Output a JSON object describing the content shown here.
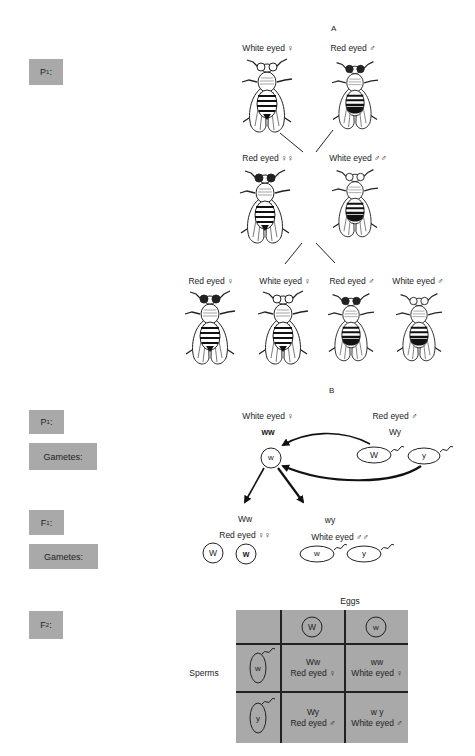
{
  "section_a": {
    "title": "A",
    "p1_label": "P",
    "p1_sub": "1",
    "p1_suffix": ":",
    "parents": [
      {
        "caption": "White eyed ♀",
        "eye": "white",
        "sex": "female"
      },
      {
        "caption": "Red eyed ♂",
        "eye": "red",
        "sex": "male"
      }
    ],
    "f1": [
      {
        "caption": "Red eyed ♀♀",
        "eye": "red",
        "sex": "female"
      },
      {
        "caption": "White eyed ♂♂",
        "eye": "white",
        "sex": "male"
      }
    ],
    "f2": [
      {
        "caption": "Red eyed ♀",
        "eye": "red",
        "sex": "female"
      },
      {
        "caption": "White eyed ♀",
        "eye": "white",
        "sex": "female"
      },
      {
        "caption": "Red eyed ♂",
        "eye": "red",
        "sex": "male"
      },
      {
        "caption": "White eyed ♂",
        "eye": "white",
        "sex": "male"
      }
    ]
  },
  "section_b": {
    "title": "B",
    "labels": {
      "p1": "P",
      "p1_sub": "1",
      "gametes_1": "Gametes:",
      "f1": "F",
      "f1_sub": "1",
      "gametes_2": "Gametes:",
      "f2": "F",
      "f2_sub": "2"
    },
    "p1_female": {
      "caption": "White eyed ♀",
      "genotype": "ww",
      "gamete": "w"
    },
    "p1_male": {
      "caption": "Red eyed ♂",
      "genotype": "Wy",
      "gametes": [
        "W",
        "y"
      ]
    },
    "f1_female": {
      "genotype": "Ww",
      "caption": "Red eyed ♀♀",
      "gametes": [
        "W",
        "w"
      ]
    },
    "f1_male": {
      "genotype": "wy",
      "caption": "White eyed ♂♂",
      "gametes": [
        "w",
        "y"
      ]
    },
    "punnett": {
      "eggs_label": "Eggs",
      "sperms_label": "Sperms",
      "eggs": [
        "W",
        "w"
      ],
      "sperms": [
        "w",
        "y"
      ],
      "cells": [
        [
          {
            "genotype": "Ww",
            "phenotype": "Red eyed ♀"
          },
          {
            "genotype": "ww",
            "phenotype": "White eyed ♀"
          }
        ],
        [
          {
            "genotype": "Wy",
            "phenotype": "Red eyed ♂"
          },
          {
            "genotype": "w y",
            "phenotype": "White eyed ♂"
          }
        ]
      ]
    }
  }
}
